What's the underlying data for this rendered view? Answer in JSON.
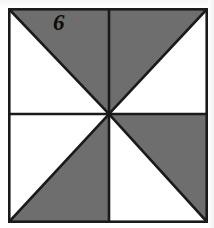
{
  "figure": {
    "label": "6",
    "type": "pinwheel-square",
    "colors": {
      "shaded": "#6e6e6e",
      "unshaded": "#ffffff",
      "line": "#1a1a1a",
      "background": "#ffffff"
    },
    "geometry": {
      "outer_square": {
        "x": 9,
        "y": 9,
        "width": 198,
        "height": 213
      },
      "center": {
        "x": 110,
        "y": 114
      },
      "line_width": 2.6
    },
    "quadrants": [
      {
        "name": "top-left",
        "diagonal": "top-left-to-bottom-right",
        "shaded_half": "upper-right",
        "unshaded_half": "lower-left"
      },
      {
        "name": "top-right",
        "diagonal": "top-left-to-bottom-right",
        "shaded_half": "upper-left",
        "unshaded_half": "lower-right"
      },
      {
        "name": "bottom-left",
        "diagonal": "bottom-left-to-top-right",
        "shaded_half": "lower-right",
        "unshaded_half": "upper-left"
      },
      {
        "name": "bottom-right",
        "diagonal": "top-left-to-bottom-right",
        "shaded_half": "upper-right",
        "unshaded_half": "lower-left"
      }
    ]
  }
}
